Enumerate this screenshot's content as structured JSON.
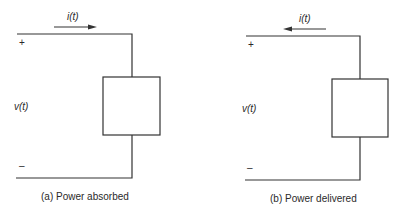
{
  "panels": [
    {
      "id": "a",
      "current_label": "i(t)",
      "current_direction": "right",
      "voltage_label": "v(t)",
      "plus_sign": "+",
      "minus_sign": "–",
      "caption": "(a)  Power absorbed"
    },
    {
      "id": "b",
      "current_label": "i(t)",
      "current_direction": "left",
      "voltage_label": "v(t)",
      "plus_sign": "+",
      "minus_sign": "–",
      "caption": "(b)  Power delivered"
    }
  ],
  "colors": {
    "line": "#333333",
    "background": "#ffffff"
  }
}
